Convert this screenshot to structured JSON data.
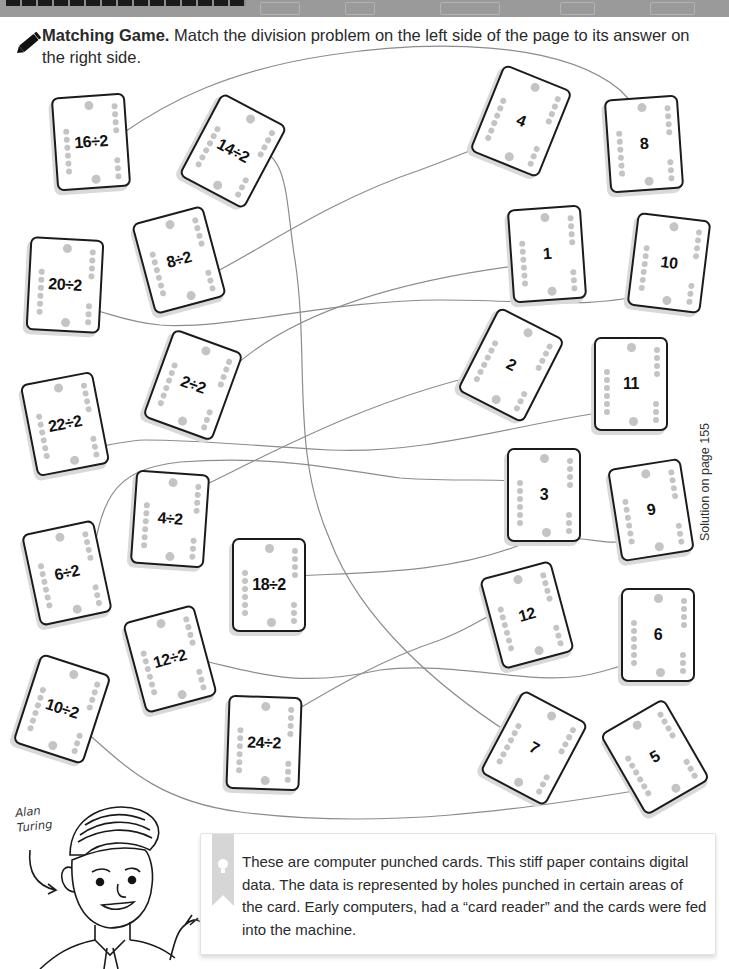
{
  "banner": {
    "title_obscured": true
  },
  "instructions": {
    "icon": "pencil-icon",
    "title": "Matching Game.",
    "body": " Match the division problem on the left side of the page to its answer on the right side."
  },
  "side_note": "Solution on page 155",
  "problems": [
    {
      "label": "16÷2",
      "x": 54,
      "y": 95,
      "rot": -4
    },
    {
      "label": "14÷2",
      "x": 196,
      "y": 104,
      "rot": 28
    },
    {
      "label": "8÷2",
      "x": 142,
      "y": 213,
      "rot": -15
    },
    {
      "label": "20÷2",
      "x": 28,
      "y": 238,
      "rot": 3
    },
    {
      "label": "2÷2",
      "x": 156,
      "y": 338,
      "rot": 20
    },
    {
      "label": "22÷2",
      "x": 28,
      "y": 377,
      "rot": -11
    },
    {
      "label": "4÷2",
      "x": 133,
      "y": 472,
      "rot": 4
    },
    {
      "label": "6÷2",
      "x": 30,
      "y": 526,
      "rot": -12
    },
    {
      "label": "18÷2",
      "x": 232,
      "y": 538,
      "rot": 0
    },
    {
      "label": "12÷2",
      "x": 133,
      "y": 612,
      "rot": -15
    },
    {
      "label": "10÷2",
      "x": 25,
      "y": 662,
      "rot": 18
    },
    {
      "label": "24÷2",
      "x": 227,
      "y": 696,
      "rot": 2
    }
  ],
  "answers": [
    {
      "label": "4",
      "x": 484,
      "y": 74,
      "rot": 22
    },
    {
      "label": "8",
      "x": 607,
      "y": 97,
      "rot": -4
    },
    {
      "label": "1",
      "x": 510,
      "y": 207,
      "rot": -4
    },
    {
      "label": "10",
      "x": 632,
      "y": 216,
      "rot": 7
    },
    {
      "label": "2",
      "x": 474,
      "y": 318,
      "rot": 27
    },
    {
      "label": "11",
      "x": 594,
      "y": 337,
      "rot": 0
    },
    {
      "label": "3",
      "x": 507,
      "y": 448,
      "rot": 0
    },
    {
      "label": "9",
      "x": 614,
      "y": 463,
      "rot": -9
    },
    {
      "label": "12",
      "x": 490,
      "y": 568,
      "rot": -15
    },
    {
      "label": "6",
      "x": 621,
      "y": 588,
      "rot": 0
    },
    {
      "label": "7",
      "x": 497,
      "y": 701,
      "rot": 28
    },
    {
      "label": "5",
      "x": 618,
      "y": 710,
      "rot": -30
    }
  ],
  "fact_box": {
    "icon": "lightbulb-icon",
    "text": "These are computer punched cards. This stiff paper contains digital data. The data is represented by holes punched in certain areas of the card. Early computers, had a “card reader” and the cards were fed into the machine."
  },
  "character": {
    "name_line1": "Alan",
    "name_line2": "Turing"
  },
  "colors": {
    "banner": "#9a9a9a",
    "card_border": "#1b1b1b",
    "hole": "#c4c4c4",
    "line": "#8c8c8c",
    "ribbon": "#d6d6d6"
  }
}
